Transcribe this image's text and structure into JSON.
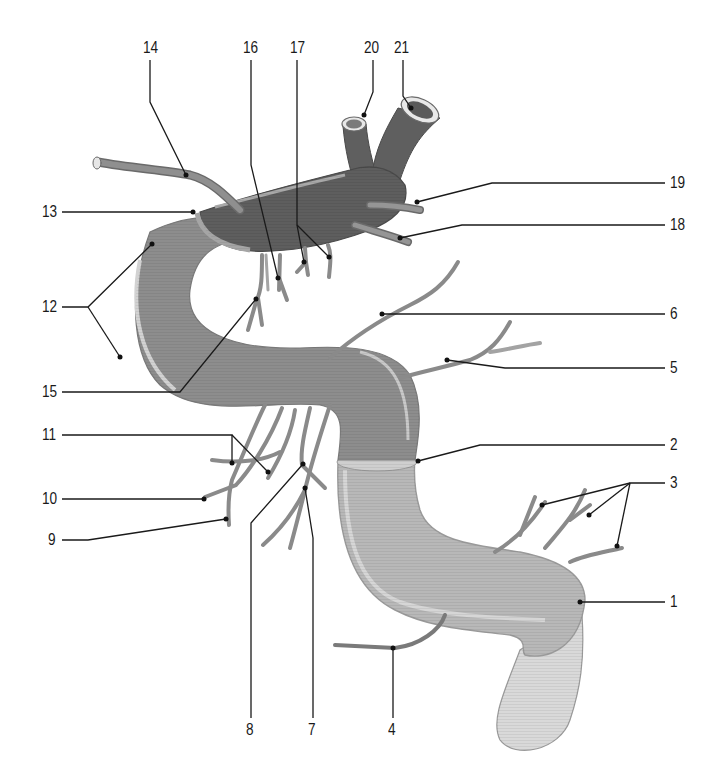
{
  "figure": {
    "type": "anatomical-diagram",
    "colors": {
      "dark_segment": "#5e5e5e",
      "mid_segment": "#8c8c8c",
      "light_segment": "#b9b9b9",
      "lightest_segment": "#d8d8d8",
      "highlight": "#d4d4d4",
      "vessel": "#8a8a8a",
      "vessel_edge": "#6a6a6a",
      "leader_line": "#1a1a1a"
    }
  },
  "labels": {
    "l1": "1",
    "l2": "2",
    "l3": "3",
    "l4": "4",
    "l5": "5",
    "l6": "6",
    "l7": "7",
    "l8": "8",
    "l9": "9",
    "l10": "10",
    "l11": "11",
    "l12": "12",
    "l13": "13",
    "l14": "14",
    "l15": "15",
    "l16": "16",
    "l17": "17",
    "l18": "18",
    "l19": "19",
    "l20": "20",
    "l21": "21"
  }
}
